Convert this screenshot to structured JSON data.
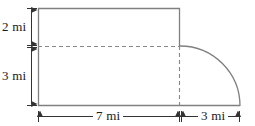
{
  "figure": {
    "type": "geometry-diagram",
    "unit": "mi",
    "colors": {
      "stroke": "#808080",
      "dashed_stroke": "#888888",
      "arrow": "#333333",
      "text": "#1a1a1a",
      "background": "#ffffff"
    },
    "labels": {
      "height_upper": "2 mi",
      "height_lower": "3 mi",
      "width_left": "7 mi",
      "width_right": "3 mi"
    },
    "dimensions": {
      "rectangle_width": 7,
      "rectangle_total_height": 5,
      "upper_segment_height": 2,
      "lower_segment_height": 3,
      "quarter_ellipse_horizontal_radius": 3,
      "quarter_ellipse_vertical_radius": 3
    },
    "geometry": {
      "rect_left": 38,
      "rect_right": 180,
      "rect_top": 8,
      "rect_bottom": 106,
      "divider_y": 46,
      "arc_end_x": 240,
      "vdim_x": 31,
      "hdim_y": 116
    }
  }
}
